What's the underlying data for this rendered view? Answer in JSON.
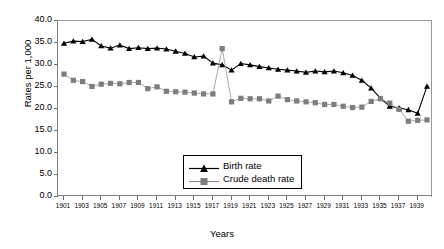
{
  "chart_data": {
    "type": "line",
    "title": "",
    "xlabel": "Years",
    "ylabel": "Rates per 1,000",
    "ylim": [
      0.0,
      40.0
    ],
    "yticks": [
      "0.0",
      "5.0",
      "10.0",
      "15.0",
      "20.0",
      "25.0",
      "30.0",
      "35.0",
      "40.0"
    ],
    "ytick_values": [
      0.0,
      5.0,
      10.0,
      15.0,
      20.0,
      25.0,
      30.0,
      35.0,
      40.0
    ],
    "grid": false,
    "legend_position": "lower-center",
    "x": [
      1901,
      1902,
      1903,
      1904,
      1905,
      1906,
      1907,
      1908,
      1909,
      1910,
      1911,
      1912,
      1913,
      1914,
      1915,
      1916,
      1917,
      1918,
      1919,
      1920,
      1921,
      1922,
      1923,
      1924,
      1925,
      1926,
      1927,
      1928,
      1929,
      1930,
      1931,
      1932,
      1933,
      1934,
      1935,
      1936,
      1937,
      1938,
      1939,
      1940
    ],
    "xtick_labels": [
      "1901",
      "1903",
      "1905",
      "1907",
      "1909",
      "1911",
      "1913",
      "1915",
      "1917",
      "1919",
      "1921",
      "1923",
      "1925",
      "1927",
      "1929",
      "1931",
      "1933",
      "1935",
      "1937",
      "1939"
    ],
    "xtick_values": [
      1901,
      1903,
      1905,
      1907,
      1909,
      1911,
      1913,
      1915,
      1917,
      1919,
      1921,
      1923,
      1925,
      1927,
      1929,
      1931,
      1933,
      1935,
      1937,
      1939
    ],
    "series": [
      {
        "name": "Birth rate",
        "color": "#000000",
        "marker": "triangle",
        "values": [
          34.7,
          35.2,
          35.1,
          35.6,
          34.1,
          33.6,
          34.3,
          33.5,
          33.7,
          33.5,
          33.6,
          33.4,
          32.9,
          32.4,
          31.6,
          31.8,
          30.2,
          29.8,
          28.6,
          30.1,
          29.8,
          29.4,
          29.1,
          28.8,
          28.6,
          28.4,
          28.1,
          28.4,
          28.2,
          28.4,
          28.0,
          27.4,
          26.3,
          24.5,
          22.2,
          20.4,
          20.0,
          19.6,
          18.8,
          24.9
        ]
      },
      {
        "name": "Crude death rate",
        "color": "#808080",
        "marker": "square",
        "values": [
          27.7,
          26.3,
          26.0,
          24.9,
          25.4,
          25.6,
          25.5,
          25.8,
          25.8,
          24.4,
          24.8,
          23.8,
          23.7,
          23.6,
          23.4,
          23.2,
          23.2,
          33.5,
          21.4,
          22.2,
          22.1,
          22.1,
          21.6,
          22.7,
          21.9,
          21.6,
          21.4,
          21.2,
          20.8,
          20.8,
          20.4,
          20.1,
          20.2,
          21.5,
          22.1,
          21.1,
          19.7,
          17.0,
          17.2,
          17.3
        ]
      }
    ]
  }
}
